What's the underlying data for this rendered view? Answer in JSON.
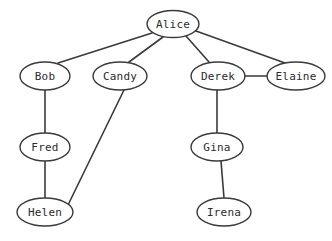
{
  "diagram": {
    "type": "graph",
    "background_color": "#ffffff",
    "stroke_color": "#3a3a3a",
    "node_fill_color": "#ffffff",
    "label_color": "#2b2b2b",
    "nodes": [
      {
        "id": "alice",
        "label": "Alice",
        "cx": 173,
        "cy": 24,
        "rx": 26,
        "ry": 13.5
      },
      {
        "id": "bob",
        "label": "Bob",
        "cx": 45,
        "cy": 76,
        "rx": 25,
        "ry": 14
      },
      {
        "id": "candy",
        "label": "Candy",
        "cx": 120,
        "cy": 76,
        "rx": 27,
        "ry": 14
      },
      {
        "id": "derek",
        "label": "Derek",
        "cx": 218,
        "cy": 76,
        "rx": 27,
        "ry": 14
      },
      {
        "id": "elaine",
        "label": "Elaine",
        "cx": 296,
        "cy": 76,
        "rx": 29,
        "ry": 14
      },
      {
        "id": "fred",
        "label": "Fred",
        "cx": 45,
        "cy": 147,
        "rx": 25,
        "ry": 14
      },
      {
        "id": "gina",
        "label": "Gina",
        "cx": 217,
        "cy": 147,
        "rx": 26,
        "ry": 14
      },
      {
        "id": "helen",
        "label": "Helen",
        "cx": 45,
        "cy": 212,
        "rx": 28,
        "ry": 14
      },
      {
        "id": "irena",
        "label": "Irena",
        "cx": 224,
        "cy": 212,
        "rx": 27,
        "ry": 14
      }
    ],
    "edges": [
      {
        "id": "alice-bob",
        "from": "alice",
        "to": "bob",
        "x1": 152,
        "y1": 33,
        "x2": 58,
        "y2": 63
      },
      {
        "id": "alice-candy",
        "from": "alice",
        "to": "candy",
        "x1": 163,
        "y1": 37,
        "x2": 129,
        "y2": 62
      },
      {
        "id": "alice-derek",
        "from": "alice",
        "to": "derek",
        "x1": 186,
        "y1": 36,
        "x2": 209,
        "y2": 62
      },
      {
        "id": "alice-elaine",
        "from": "alice",
        "to": "elaine",
        "x1": 196,
        "y1": 31,
        "x2": 285,
        "y2": 63
      },
      {
        "id": "bob-fred",
        "from": "bob",
        "to": "fred",
        "x1": 45,
        "y1": 90,
        "x2": 45,
        "y2": 133
      },
      {
        "id": "fred-helen",
        "from": "fred",
        "to": "helen",
        "x1": 45,
        "y1": 161,
        "x2": 45,
        "y2": 198
      },
      {
        "id": "candy-helen",
        "from": "candy",
        "to": "helen",
        "x1": 124,
        "y1": 90,
        "x2": 68,
        "y2": 205
      },
      {
        "id": "derek-elaine",
        "from": "derek",
        "to": "elaine",
        "x1": 245,
        "y1": 76,
        "x2": 267,
        "y2": 76
      },
      {
        "id": "derek-gina",
        "from": "derek",
        "to": "gina",
        "x1": 217,
        "y1": 90,
        "x2": 217,
        "y2": 133
      },
      {
        "id": "gina-irena",
        "from": "gina",
        "to": "irena",
        "x1": 221,
        "y1": 161,
        "x2": 224,
        "y2": 198
      }
    ]
  }
}
